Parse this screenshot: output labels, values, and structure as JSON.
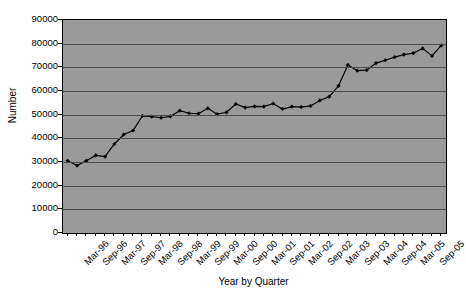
{
  "chart_data": {
    "type": "line",
    "title": "",
    "xlabel": "Year by Quarter",
    "ylabel": "Number",
    "ylim": [
      0,
      90000
    ],
    "ytick_values": [
      0,
      10000,
      20000,
      30000,
      40000,
      50000,
      60000,
      70000,
      80000,
      90000
    ],
    "ytick_labels": [
      "0",
      "10000",
      "20000",
      "30000",
      "40000",
      "50000",
      "60000",
      "70000",
      "80000",
      "90000"
    ],
    "grid": true,
    "legend": "none",
    "marker": "diamond",
    "line_color": "#000000",
    "plot_background": "#9a9a9a",
    "page_background": "#ffffff",
    "categories": [
      "Mar-96",
      "Jun-96",
      "Sep-96",
      "Dec-96",
      "Mar-97",
      "Jun-97",
      "Sep-97",
      "Dec-97",
      "Mar-98",
      "Jun-98",
      "Sep-98",
      "Dec-98",
      "Mar-99",
      "Jun-99",
      "Sep-99",
      "Dec-99",
      "Mar-00",
      "Jun-00",
      "Sep-00",
      "Dec-00",
      "Mar-01",
      "Jun-01",
      "Sep-01",
      "Dec-01",
      "Mar-02",
      "Jun-02",
      "Sep-02",
      "Dec-02",
      "Mar-03",
      "Jun-03",
      "Sep-03",
      "Dec-03",
      "Mar-04",
      "Jun-04",
      "Sep-04",
      "Dec-04",
      "Mar-05",
      "Jun-05",
      "Sep-05",
      "Dec-05"
    ],
    "xtick_labels": [
      "Mar-96",
      "Sep-96",
      "Mar-97",
      "Sep-97",
      "Mar-98",
      "Sep-98",
      "Mar-99",
      "Sep-99",
      "Mar-00",
      "Sep-00",
      "Mar-01",
      "Sep-01",
      "Mar-02",
      "Sep-02",
      "Mar-03",
      "Sep-03",
      "Mar-04",
      "Sep-04",
      "Mar-05",
      "Sep-05"
    ],
    "xtick_indices": [
      0,
      2,
      4,
      6,
      8,
      10,
      12,
      14,
      16,
      18,
      20,
      22,
      24,
      26,
      28,
      30,
      32,
      34,
      36,
      38
    ],
    "values": [
      30500,
      28500,
      30500,
      32800,
      32300,
      37600,
      41600,
      43300,
      49500,
      49200,
      48700,
      49300,
      51700,
      50600,
      50400,
      52700,
      50200,
      51000,
      54500,
      53000,
      53500,
      53400,
      54700,
      52400,
      53400,
      53200,
      53700,
      56000,
      57600,
      62200,
      71000,
      68600,
      68800,
      71800,
      73000,
      74300,
      75400,
      76000,
      78000,
      74800
    ],
    "last_value": 79300
  }
}
